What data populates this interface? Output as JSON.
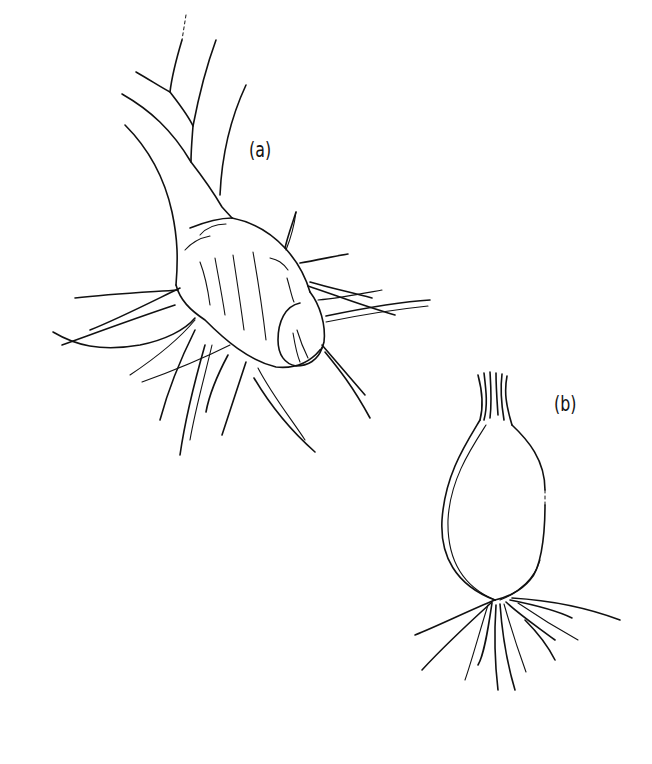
{
  "figure": {
    "subjects": [
      {
        "id": "a",
        "label": "(a)",
        "description": "corm with stem and roots"
      },
      {
        "id": "b",
        "label": "(b)",
        "description": "bulb with roots"
      }
    ],
    "colors": {
      "ink": "#111111",
      "background": "#ffffff"
    }
  }
}
